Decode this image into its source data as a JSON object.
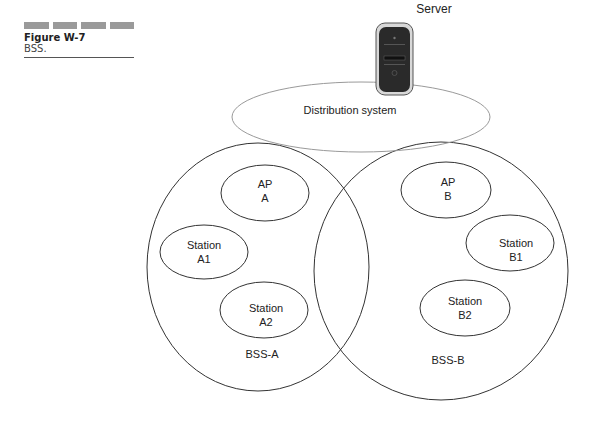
{
  "figure": {
    "number": "Figure W-7",
    "caption": "BSS."
  },
  "diagram": {
    "server_label": "Server",
    "distribution_label": "Distribution system",
    "bss_a": {
      "label": "BSS-A",
      "nodes": [
        {
          "line1": "AP",
          "line2": "A"
        },
        {
          "line1": "Station",
          "line2": "A1"
        },
        {
          "line1": "Station",
          "line2": "A2"
        }
      ]
    },
    "bss_b": {
      "label": "BSS-B",
      "nodes": [
        {
          "line1": "AP",
          "line2": "B"
        },
        {
          "line1": "Station",
          "line2": "B1"
        },
        {
          "line1": "Station",
          "line2": "B2"
        }
      ]
    },
    "colors": {
      "stroke": "#333333",
      "distribution_stroke": "#9a9a9a",
      "server_body": "#2a2a2a"
    }
  }
}
